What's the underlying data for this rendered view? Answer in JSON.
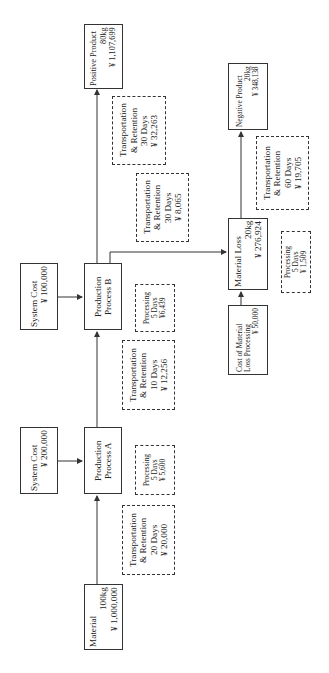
{
  "diagram": {
    "orientation": "rotated-90-ccw",
    "nodes": {
      "material": {
        "title": "Material",
        "weight": "100kg",
        "cost": "¥ 1,000,000"
      },
      "system_cost_a": {
        "title": "System Cost",
        "cost": "¥ 200,000"
      },
      "process_a": {
        "line1": "Production",
        "line2": "Process A"
      },
      "system_cost_b": {
        "title": "System Cost",
        "cost": "¥ 100,000"
      },
      "process_b": {
        "line1": "Production",
        "line2": "Process B"
      },
      "positive_product": {
        "title": "Positive Product",
        "weight": "80kg",
        "cost": "¥ 1,107,699"
      },
      "material_loss": {
        "title": "Material Loss",
        "weight": "20kg",
        "cost": "¥ 276,924"
      },
      "loss_processing_cost": {
        "line1": "Cost of Material",
        "line2": "Loss Processing",
        "cost": "¥ 50,000"
      },
      "negative_product": {
        "title": "Negative Product",
        "weight": "20kg",
        "cost": "¥ 348,138"
      }
    },
    "cost_notes": {
      "tr_material_to_a": {
        "line1": "Transportation",
        "line2": "& Retention",
        "days": "20 Days",
        "cost": "¥ 20,000"
      },
      "proc_a": {
        "line1": "Processing",
        "days": "5 Days",
        "cost": "¥ 5,600"
      },
      "tr_a_to_b": {
        "line1": "Transportation",
        "line2": "& Retention",
        "days": "10 Days",
        "cost": "¥ 12,256"
      },
      "proc_b": {
        "line1": "Processing",
        "days": "5 Days",
        "cost": "¥6,439"
      },
      "tr_b_to_positive": {
        "line1": "Transportation",
        "line2": "& Retention",
        "days": "30 Days",
        "cost": "¥ 32,263"
      },
      "tr_b_to_loss": {
        "line1": "Transportation",
        "line2": "& Retention",
        "days": "30 Days",
        "cost": "¥ 8,065"
      },
      "proc_loss": {
        "line1": "Processing",
        "days": "5 Days",
        "cost": "¥ 1,509"
      },
      "tr_loss_to_negative": {
        "line1": "Transportation",
        "line2": "& Retention",
        "days": "60 Days",
        "cost": "¥ 19,705"
      }
    },
    "colors": {
      "stroke": "#333333",
      "background": "#ffffff"
    }
  }
}
